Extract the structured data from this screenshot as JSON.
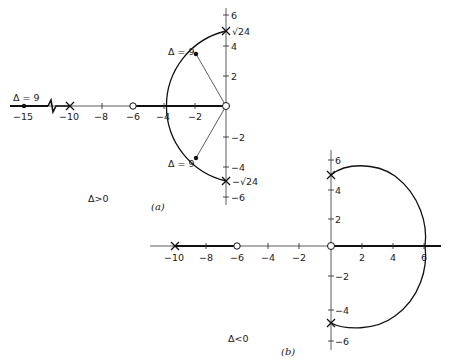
{
  "figure_a": {
    "caption": "(a)",
    "condition_label": "Δ>0",
    "x_tick_labels": [
      "−15",
      "−10",
      "−8",
      "−6",
      "−4",
      "−2"
    ],
    "y_tick_labels": [
      "6",
      "4",
      "2",
      "−2",
      "−4",
      "−6"
    ],
    "pole_upper_label": "√24",
    "pole_lower_label": "−√24",
    "delta_upper_label": "Δ = 9",
    "delta_lower_label": "Δ = 9",
    "delta_axis_label": "Δ = 9",
    "poles": [
      {
        "re": -10,
        "im": 0
      },
      {
        "re": 0,
        "im": 4.9
      },
      {
        "re": 0,
        "im": -4.9
      }
    ],
    "zeros": [
      {
        "re": -6,
        "im": 0
      },
      {
        "re": 0,
        "im": 0
      }
    ],
    "marked_points": [
      {
        "re": -15,
        "im": 0,
        "label": "Δ = 9"
      },
      {
        "re": -2,
        "im": 3.7,
        "label": "Δ = 9"
      },
      {
        "re": -2,
        "im": -3.7,
        "label": "Δ = 9"
      }
    ]
  },
  "figure_b": {
    "caption": "(b)",
    "condition_label": "Δ<0",
    "x_tick_labels": [
      "−10",
      "−8",
      "−6",
      "−4",
      "−2",
      "2",
      "4",
      "6"
    ],
    "y_tick_labels": [
      "6",
      "4",
      "2",
      "−2",
      "−4",
      "−6"
    ],
    "poles": [
      {
        "re": -10,
        "im": 0
      },
      {
        "re": 0,
        "im": 4.9
      },
      {
        "re": 0,
        "im": -4.9
      }
    ],
    "zeros": [
      {
        "re": -6,
        "im": 0
      },
      {
        "re": 0,
        "im": 0
      }
    ]
  }
}
